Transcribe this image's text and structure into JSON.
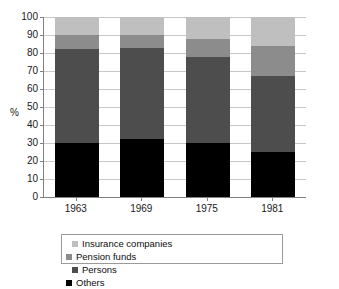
{
  "title": "",
  "axis": {
    "ylabel": "%",
    "yticks": [
      100,
      90,
      80,
      70,
      60,
      50,
      40,
      30,
      20,
      10,
      0
    ]
  },
  "legend": {
    "items": [
      {
        "label": "Insurance companies",
        "color": "#bfbfbf"
      },
      {
        "label": "Pension funds",
        "color": "#8c8c8c"
      },
      {
        "label": "Persons",
        "color": "#4d4d4d"
      },
      {
        "label": "Others",
        "color": "#000000"
      }
    ]
  },
  "chart_data": {
    "type": "bar",
    "subtype": "stacked-bar",
    "title": "",
    "xlabel": "",
    "ylabel": "%",
    "ylim": [
      0,
      100
    ],
    "ytick_step": 10,
    "grid": true,
    "legend_position": "bottom",
    "stack_order_bottom_to_top": [
      "Others",
      "Persons",
      "Pension funds",
      "Insurance companies"
    ],
    "categories": [
      "1963",
      "1969",
      "1975",
      "1981"
    ],
    "series": [
      {
        "name": "Insurance companies",
        "color": "#bfbfbf",
        "values": [
          10,
          10,
          12,
          16
        ]
      },
      {
        "name": "Pension funds",
        "color": "#8c8c8c",
        "values": [
          8,
          7,
          10,
          17
        ]
      },
      {
        "name": "Persons",
        "color": "#4d4d4d",
        "values": [
          52,
          51,
          48,
          42
        ]
      },
      {
        "name": "Others",
        "color": "#000000",
        "values": [
          30,
          32,
          30,
          25
        ]
      }
    ],
    "cumulative_tops": {
      "1963": {
        "Others": 30,
        "Persons": 82,
        "Pension funds": 90,
        "Insurance companies": 100
      },
      "1969": {
        "Others": 32,
        "Persons": 83,
        "Pension funds": 90,
        "Insurance companies": 100
      },
      "1975": {
        "Others": 30,
        "Persons": 78,
        "Pension funds": 88,
        "Insurance companies": 100
      },
      "1981": {
        "Others": 25,
        "Persons": 67,
        "Pension funds": 84,
        "Insurance companies": 100
      }
    }
  }
}
